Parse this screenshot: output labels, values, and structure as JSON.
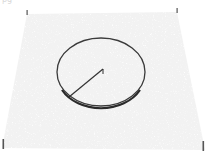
{
  "image": {
    "description": "Grayscale 3D perspective surface scan of a noisy flat plane with an elliptical ring feature and a radius line",
    "caption_fragment": "pg",
    "colors": {
      "background": "#ffffff",
      "surface_light": "#e6e6e6",
      "surface_dark": "#8a8a8a",
      "ring": "#3a3a3a",
      "ring_shadow": "#2a2a2a",
      "radius_line": "#333333",
      "corner_ticks": "#555555"
    },
    "surface_plane": {
      "top_left": [
        27,
        14
      ],
      "top_right": [
        177,
        12
      ],
      "bottom_right": [
        205,
        150
      ],
      "bottom_left": [
        2,
        148
      ]
    },
    "ring": {
      "center": [
        101,
        72
      ],
      "rx": 44,
      "ry": 34
    },
    "radius_line": {
      "from": [
        103,
        69
      ],
      "to": [
        69,
        97
      ]
    },
    "corner_ticks": [
      {
        "name": "top-left",
        "x": 27,
        "y": 12
      },
      {
        "name": "top-right",
        "x": 177,
        "y": 10
      },
      {
        "name": "bottom-left",
        "x": 3,
        "y": 143
      },
      {
        "name": "bottom-right",
        "x": 203,
        "y": 145
      }
    ]
  }
}
